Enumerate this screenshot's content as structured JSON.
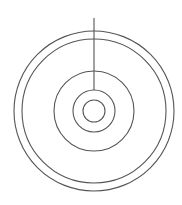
{
  "diagram": {
    "stroke_color": "#555555",
    "background": "#ffffff",
    "center": {
      "cx": 94,
      "cy": 111
    },
    "circles": [
      {
        "name": "outer-ring",
        "r": 80
      },
      {
        "name": "second-ring",
        "r": 72
      },
      {
        "name": "third-ring",
        "r": 40
      },
      {
        "name": "fourth-ring",
        "r": 21
      },
      {
        "name": "inner-ring",
        "r": 11
      }
    ],
    "line": {
      "x1": 94,
      "y1": 18,
      "x2": 94,
      "y2": 90
    }
  }
}
